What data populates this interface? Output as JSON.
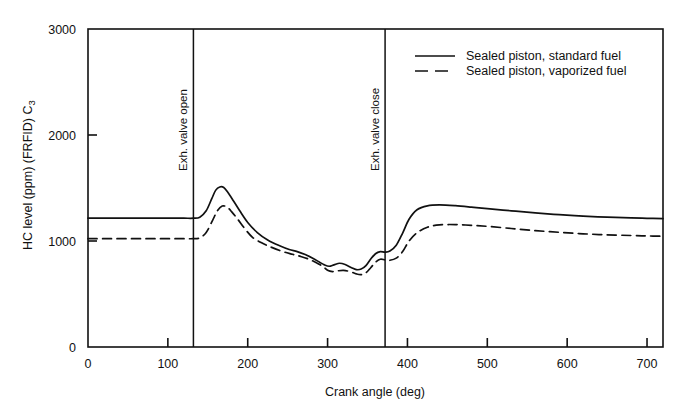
{
  "chart_data": {
    "type": "line",
    "title": "",
    "xlabel": "Crank angle (deg)",
    "ylabel": "HC level (ppm) (FRFID) C",
    "ylabel_sub": "3",
    "xlim": [
      0,
      720
    ],
    "ylim": [
      0,
      3000
    ],
    "xticks": [
      0,
      100,
      200,
      300,
      400,
      500,
      600,
      700
    ],
    "xtick_labels": [
      "0",
      "100",
      "200",
      "300",
      "400",
      "500",
      "600",
      "700"
    ],
    "yticks": [
      0,
      1000,
      2000,
      3000
    ],
    "ytick_labels": [
      "0",
      "1000",
      "2000",
      "3000"
    ],
    "grid": false,
    "legend_position": "top-right",
    "series": [
      {
        "name": "Sealed piston, standard fuel",
        "style": "solid",
        "color": "#111111",
        "x": [
          0,
          20,
          40,
          60,
          80,
          100,
          120,
          132,
          140,
          148,
          155,
          160,
          165,
          170,
          175,
          182,
          190,
          200,
          212,
          225,
          240,
          252,
          262,
          272,
          282,
          290,
          296,
          302,
          308,
          315,
          322,
          330,
          336,
          342,
          348,
          354,
          360,
          366,
          372,
          378,
          386,
          394,
          402,
          412,
          425,
          440,
          460,
          480,
          500,
          530,
          560,
          590,
          620,
          650,
          680,
          700,
          720
        ],
        "y": [
          1215,
          1215,
          1215,
          1215,
          1215,
          1215,
          1215,
          1215,
          1225,
          1285,
          1400,
          1480,
          1510,
          1505,
          1460,
          1380,
          1285,
          1175,
          1080,
          1010,
          955,
          920,
          900,
          872,
          835,
          800,
          775,
          762,
          775,
          790,
          778,
          748,
          730,
          735,
          768,
          830,
          880,
          900,
          895,
          905,
          960,
          1075,
          1205,
          1295,
          1332,
          1340,
          1333,
          1320,
          1305,
          1285,
          1265,
          1248,
          1235,
          1225,
          1218,
          1214,
          1212
        ]
      },
      {
        "name": "Sealed piston, vaporized fuel",
        "style": "dashed",
        "color": "#111111",
        "x": [
          0,
          20,
          40,
          60,
          80,
          100,
          120,
          132,
          140,
          148,
          156,
          162,
          168,
          174,
          180,
          188,
          196,
          206,
          218,
          230,
          244,
          256,
          266,
          276,
          286,
          294,
          300,
          306,
          312,
          320,
          328,
          336,
          342,
          348,
          354,
          360,
          366,
          372,
          378,
          386,
          394,
          402,
          412,
          425,
          440,
          460,
          480,
          500,
          530,
          560,
          590,
          620,
          650,
          680,
          700,
          720
        ],
        "y": [
          1022,
          1022,
          1022,
          1022,
          1022,
          1022,
          1022,
          1022,
          1030,
          1080,
          1195,
          1285,
          1330,
          1320,
          1275,
          1200,
          1120,
          1035,
          980,
          940,
          900,
          875,
          855,
          830,
          795,
          760,
          725,
          712,
          718,
          722,
          712,
          690,
          683,
          700,
          748,
          800,
          828,
          822,
          818,
          838,
          900,
          1000,
          1078,
          1130,
          1152,
          1155,
          1148,
          1138,
          1118,
          1098,
          1082,
          1068,
          1058,
          1052,
          1048,
          1045
        ]
      }
    ],
    "annotations": [
      {
        "id": "exh-valve-open",
        "label": "Exh. valve open",
        "x": 132,
        "kind": "vline"
      },
      {
        "id": "exh-valve-close",
        "label": "Exh. valve close",
        "x": 372,
        "kind": "vline"
      }
    ],
    "legend": [
      {
        "label": "Sealed piston, standard fuel",
        "style": "solid"
      },
      {
        "label": "Sealed piston, vaporized fuel",
        "style": "dashed"
      }
    ]
  }
}
